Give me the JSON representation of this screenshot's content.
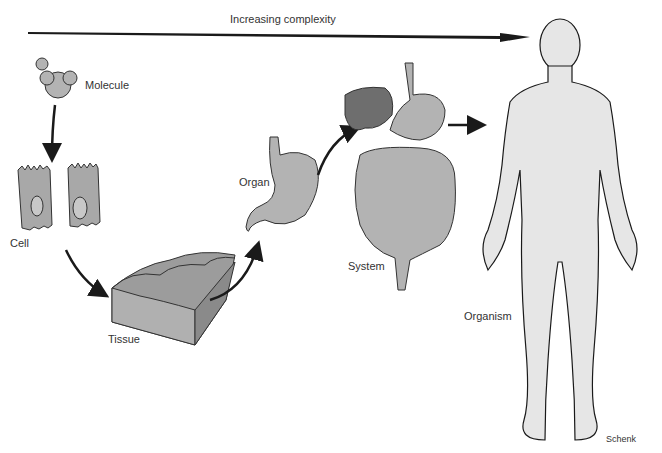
{
  "title_arrow": {
    "label": "Increasing complexity"
  },
  "stages": [
    {
      "id": "molecule",
      "label": "Molecule"
    },
    {
      "id": "cell",
      "label": "Cell"
    },
    {
      "id": "tissue",
      "label": "Tissue"
    },
    {
      "id": "organ",
      "label": "Organ"
    },
    {
      "id": "system",
      "label": "System"
    },
    {
      "id": "organism",
      "label": "Organism"
    }
  ],
  "credit": "Schenk",
  "colors": {
    "fill_light": "#e6e6e6",
    "fill_mid": "#b3b3b3",
    "fill_dark": "#6e6e6e",
    "stroke": "#1a1a1a",
    "text": "#333333"
  }
}
